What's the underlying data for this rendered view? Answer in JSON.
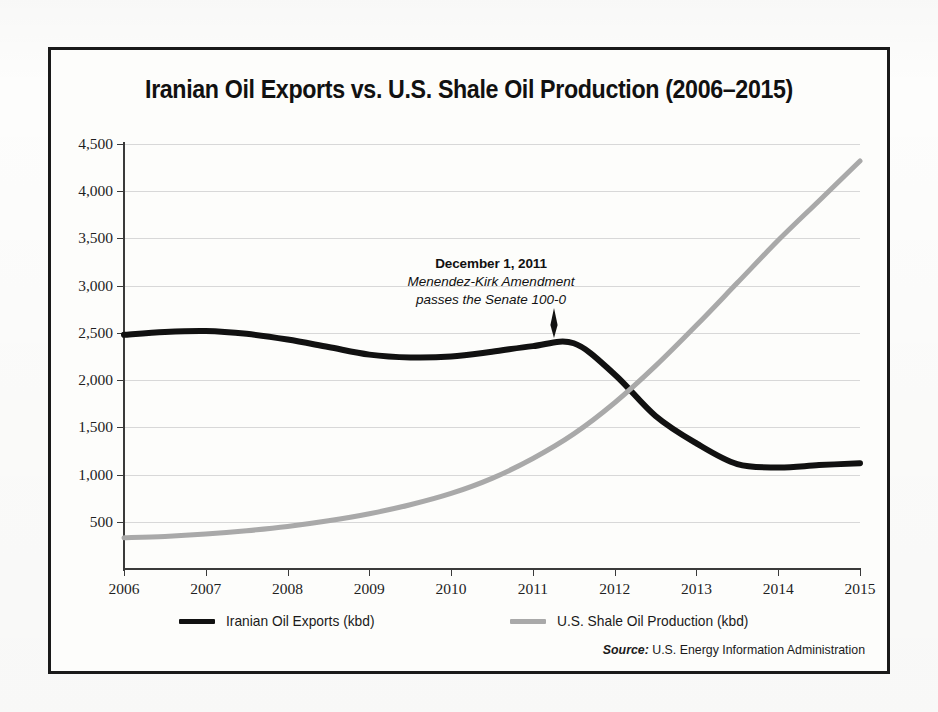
{
  "chart_data": {
    "type": "line",
    "title": "Iranian Oil Exports vs. U.S. Shale Oil Production (2006–2015)",
    "xlabel": "",
    "ylabel": "",
    "xlim": [
      2006,
      2015
    ],
    "ylim": [
      0,
      4500
    ],
    "grid": true,
    "legend_position": "bottom",
    "x_ticks": [
      "2006",
      "2007",
      "2008",
      "2009",
      "2010",
      "2011",
      "2012",
      "2013",
      "2014",
      "2015"
    ],
    "y_ticks": [
      "500",
      "1,000",
      "1,500",
      "2,000",
      "2,500",
      "3,000",
      "3,500",
      "4,000",
      "4,500"
    ],
    "y_tick_values": [
      500,
      1000,
      1500,
      2000,
      2500,
      3000,
      3500,
      4000,
      4500
    ],
    "x": [
      2006,
      2006.5,
      2007,
      2007.5,
      2008,
      2008.5,
      2009,
      2009.5,
      2010,
      2010.5,
      2011,
      2011.5,
      2012,
      2012.5,
      2013,
      2013.5,
      2014,
      2014.5,
      2015
    ],
    "series": [
      {
        "name": "Iranian Oil Exports (kbd)",
        "color": "#111111",
        "unit": "kbd",
        "values": [
          2480,
          2510,
          2520,
          2490,
          2430,
          2350,
          2270,
          2240,
          2250,
          2300,
          2360,
          2390,
          2060,
          1620,
          1330,
          1110,
          1075,
          1100,
          1120
        ]
      },
      {
        "name": "U.S. Shale Oil Production (kbd)",
        "color": "#a9a9a9",
        "unit": "kbd",
        "values": [
          330,
          345,
          370,
          405,
          450,
          510,
          585,
          680,
          800,
          960,
          1170,
          1430,
          1760,
          2150,
          2580,
          3030,
          3480,
          3900,
          4320
        ]
      }
    ],
    "annotations": [
      {
        "date": "December 1, 2011",
        "line1": "Menendez-Kirk Amendment",
        "line2": "passes the Senate 100-0",
        "points_to_x": 2011.6,
        "points_to_y": 2390
      }
    ],
    "source_label": "Source:",
    "source_text": "U.S. Energy Information Administration"
  },
  "legend": {
    "items": [
      {
        "label": "Iranian Oil Exports (kbd)",
        "color": "#111111"
      },
      {
        "label": "U.S. Shale Oil Production (kbd)",
        "color": "#a9a9a9"
      }
    ]
  }
}
